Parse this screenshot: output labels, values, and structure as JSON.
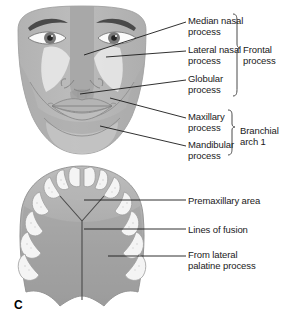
{
  "figure": {
    "panel_letter": "C",
    "colors": {
      "face_base": "#b9b9b9",
      "face_mid": "#a8a8a8",
      "face_dark": "#9a9a9a",
      "lateral_nasal": "#e8e8e8",
      "mandible": "#c9c9c9",
      "palate_fill": "#a3a3a3",
      "palate_light": "#bdbdbd",
      "tooth": "#f2f2f2",
      "tooth_outline": "#9d9d9d",
      "brow": "#4a4a4a",
      "iris": "#6e6e6e",
      "pupil": "#2b2b2b",
      "leader": "#1a1a1a",
      "text": "#1a1a1a"
    }
  },
  "face_diagram": {
    "labels": [
      {
        "id": "median-nasal-process",
        "text": "Median nasal\nprocess",
        "x": 188,
        "y": 16
      },
      {
        "id": "lateral-nasal-process",
        "text": "Lateral nasal\nprocess",
        "x": 188,
        "y": 45
      },
      {
        "id": "globular-process",
        "text": "Globular\nprocess",
        "x": 188,
        "y": 74
      },
      {
        "id": "maxillary-process",
        "text": "Maxillary\nprocess",
        "x": 188,
        "y": 112
      },
      {
        "id": "mandibular-process",
        "text": "Mandibular\nprocess",
        "x": 188,
        "y": 140
      }
    ],
    "group_labels": [
      {
        "id": "frontal-process",
        "text": "Frontal\nprocess",
        "x": 243,
        "y": 45
      },
      {
        "id": "branchial-arch-1",
        "text": "Branchial\narch 1",
        "x": 240,
        "y": 126
      }
    ]
  },
  "palate_diagram": {
    "labels": [
      {
        "id": "premaxillary-area",
        "text": "Premaxillary area",
        "x": 188,
        "y": 196
      },
      {
        "id": "lines-of-fusion",
        "text": "Lines of fusion",
        "x": 188,
        "y": 225
      },
      {
        "id": "from-lateral-palatine-process",
        "text": "From lateral\npalatine process",
        "x": 188,
        "y": 250
      }
    ]
  }
}
